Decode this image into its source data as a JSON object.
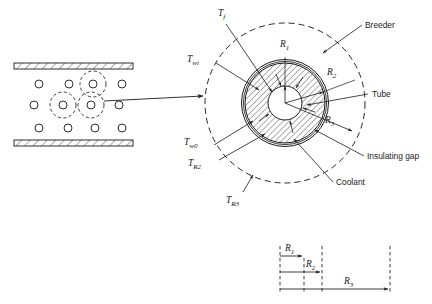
{
  "figure": {
    "left_panel": {
      "name": "duct-array-view",
      "wall_label": "hatched-duct-wall",
      "tube_count_rows": [
        4,
        4,
        4
      ],
      "unit_cell_count": 3
    },
    "connector": {
      "name": "magnification-arrow"
    },
    "main_panel": {
      "name": "magnified-unit-cell",
      "regions": {
        "coolant": "Coolant",
        "breeder": "Breeder",
        "tube": "Tube",
        "insulating_gap": "Insulating gap"
      },
      "radii": {
        "r1": "R",
        "r1_sub": "1",
        "r2": "R",
        "r2_sub": "2",
        "r3": "R",
        "r3_sub": "3"
      },
      "temperatures": {
        "tf": "T",
        "tf_sub": "f",
        "twi": "T",
        "twi_sub": "wi",
        "tw0": "T",
        "tw0_sub": "w0",
        "tr2": "T",
        "tr2_sub": "R2",
        "tr3": "T",
        "tr3_sub": "R3"
      }
    },
    "inset_panel": {
      "name": "radial-dimension-scale",
      "dims": [
        {
          "label": "R",
          "sub": "1"
        },
        {
          "label": "R",
          "sub": "2"
        },
        {
          "label": "R",
          "sub": "3"
        }
      ]
    }
  },
  "colors": {
    "ink": "#1a1a1a",
    "hatch": "#2b2b2b",
    "background": "#ffffff"
  }
}
